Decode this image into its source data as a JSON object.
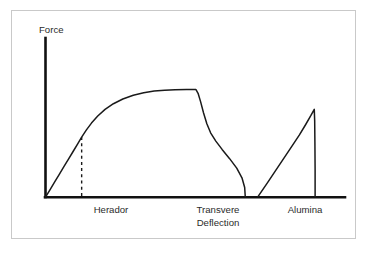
{
  "chart_data": {
    "type": "line",
    "title": "",
    "subtitle": "",
    "xlabel": "Transvere Deflection",
    "ylabel": "Force",
    "grid": false,
    "legend": "none",
    "xlim": [
      0,
      100
    ],
    "ylim": [
      0,
      100
    ],
    "axis_tick_labels": [
      "Herador",
      "Transvere",
      "Deflection",
      "Alumina"
    ],
    "annotations": [
      {
        "name": "proportional-limit-marker",
        "type": "dashed-vertical",
        "x": 17.3,
        "y_from": 0,
        "y_to": 43.4,
        "label": "Herador"
      }
    ],
    "series": [
      {
        "name": "Herador",
        "label": "Herador",
        "style": "solid",
        "color": "#1a1a1a",
        "points": [
          [
            0.0,
            0.0
          ],
          [
            2.2,
            5.5
          ],
          [
            4.4,
            11.0
          ],
          [
            6.6,
            16.5
          ],
          [
            8.8,
            22.0
          ],
          [
            11.0,
            27.5
          ],
          [
            13.2,
            33.0
          ],
          [
            15.4,
            38.5
          ],
          [
            17.3,
            43.4
          ],
          [
            19.5,
            48.4
          ],
          [
            22.0,
            53.5
          ],
          [
            25.0,
            58.6
          ],
          [
            28.5,
            63.4
          ],
          [
            32.5,
            67.5
          ],
          [
            37.0,
            70.9
          ],
          [
            42.0,
            73.6
          ],
          [
            47.0,
            75.4
          ],
          [
            52.0,
            76.6
          ],
          [
            57.0,
            77.3
          ],
          [
            62.0,
            77.6
          ],
          [
            67.5,
            77.7
          ],
          [
            72.0,
            77.7
          ],
          [
            73.0,
            75.0
          ],
          [
            74.2,
            69.0
          ],
          [
            75.6,
            61.0
          ],
          [
            77.2,
            53.0
          ],
          [
            79.0,
            46.5
          ],
          [
            81.5,
            40.5
          ],
          [
            84.5,
            34.5
          ],
          [
            88.0,
            28.0
          ],
          [
            91.5,
            21.0
          ],
          [
            94.0,
            14.0
          ],
          [
            95.3,
            7.0
          ],
          [
            95.6,
            0.0
          ]
        ]
      },
      {
        "name": "Alumina",
        "label": "Alumina",
        "style": "solid",
        "color": "#1a1a1a",
        "points": [
          [
            101.5,
            0.0
          ],
          [
            106.0,
            10.0
          ],
          [
            110.0,
            19.0
          ],
          [
            114.0,
            28.0
          ],
          [
            118.0,
            37.0
          ],
          [
            121.5,
            45.0
          ],
          [
            124.5,
            52.5
          ],
          [
            127.0,
            59.0
          ],
          [
            128.6,
            63.4
          ],
          [
            128.8,
            55.0
          ],
          [
            128.9,
            40.0
          ],
          [
            129.0,
            20.0
          ],
          [
            129.0,
            0.0
          ]
        ]
      }
    ]
  },
  "axis": {
    "y_title": "Force",
    "x_title_line1": "Transvere",
    "x_title_line2": "Deflection"
  },
  "labels": {
    "herador": "Herador",
    "transvere": "Transvere",
    "deflection": "Deflection",
    "alumina": "Alumina"
  },
  "colors": {
    "ink": "#1a1a1a",
    "axis": "#111111",
    "frame": "#c9c9c9",
    "background": "#ffffff",
    "text": "#2b2b2b"
  }
}
